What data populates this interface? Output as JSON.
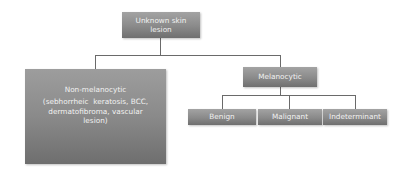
{
  "diagram": {
    "type": "tree",
    "root": {
      "label_line1": "Unknown skin",
      "label_line2": "lesion"
    },
    "nodes": {
      "non_melanocytic": {
        "title": "Non-melanocytic",
        "detail_line1": "(sebhorrheic  keratosis, BCC,",
        "detail_line2": "dermatofibroma, vascular",
        "detail_line3": "lesion)"
      },
      "melanocytic": {
        "title": "Melanocytic",
        "children": [
          {
            "label": "Benign"
          },
          {
            "label": "Malignant"
          },
          {
            "label": "Indeterminant"
          }
        ]
      }
    },
    "edges": [
      [
        "Unknown skin lesion",
        "Non-melanocytic"
      ],
      [
        "Unknown skin lesion",
        "Melanocytic"
      ],
      [
        "Melanocytic",
        "Benign"
      ],
      [
        "Melanocytic",
        "Malignant"
      ],
      [
        "Melanocytic",
        "Indeterminant"
      ]
    ],
    "colors": {
      "box_top": "#a3a3a3",
      "box_bottom": "#6f6f6f",
      "text": "#f2f2f2",
      "connector": "#6a6a6a"
    }
  }
}
